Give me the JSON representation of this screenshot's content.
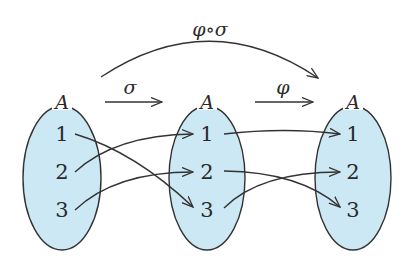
{
  "diagram": {
    "colors": {
      "set_fill": "#cce8f4",
      "stroke": "#333333",
      "text": "#2a2a2a"
    },
    "sets": [
      {
        "id": "left",
        "label": "A",
        "elements": [
          "1",
          "2",
          "3"
        ]
      },
      {
        "id": "middle",
        "label": "A",
        "elements": [
          "1",
          "2",
          "3"
        ]
      },
      {
        "id": "right",
        "label": "A",
        "elements": [
          "1",
          "2",
          "3"
        ]
      }
    ],
    "maps": {
      "sigma": {
        "label": "σ",
        "from": "left",
        "to": "middle",
        "mapping": {
          "1": "3",
          "2": "1",
          "3": "2"
        }
      },
      "phi": {
        "label": "φ",
        "from": "middle",
        "to": "right",
        "mapping": {
          "1": "1",
          "2": "3",
          "3": "2"
        }
      },
      "composition": {
        "label": "φ∘σ",
        "from": "left",
        "to": "right"
      }
    }
  }
}
